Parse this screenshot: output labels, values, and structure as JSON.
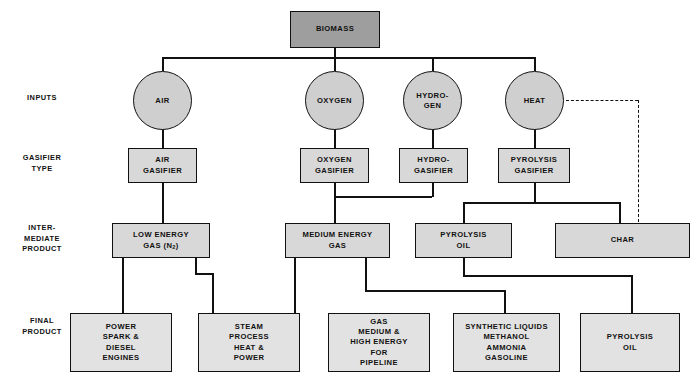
{
  "diagram": {
    "row_labels": [
      {
        "key": "inputs",
        "text": "INPUTS"
      },
      {
        "key": "gasifier",
        "text": "GASIFIER\nTYPE"
      },
      {
        "key": "intermediate",
        "text": "INTER-\nMEDIATE\nPRODUCT"
      },
      {
        "key": "final",
        "text": "FINAL\nPRODUCT"
      }
    ],
    "source": {
      "label": "BIOMASS"
    },
    "inputs": [
      {
        "label": "AIR"
      },
      {
        "label": "OXYGEN"
      },
      {
        "label": "HYDRO-\nGEN"
      },
      {
        "label": "HEAT"
      }
    ],
    "gasifiers": [
      {
        "label": "AIR\nGASIFIER"
      },
      {
        "label": "OXYGEN\nGASIFIER"
      },
      {
        "label": "HYDRO-\nGASIFIER"
      },
      {
        "label": "PYROLYSIS\nGASIFIER"
      }
    ],
    "intermediates": [
      {
        "label": "LOW ENERGY\nGAS (N2)",
        "label_pre": "LOW ENERGY\nGAS (N",
        "label_sub": "2",
        "label_post": ")"
      },
      {
        "label": "MEDIUM ENERGY\nGAS"
      },
      {
        "label": "PYROLYSIS\nOIL"
      },
      {
        "label": "CHAR"
      }
    ],
    "finals": [
      {
        "label": "POWER\nSPARK &\nDIESEL\nENGINES"
      },
      {
        "label": "STEAM\nPROCESS\nHEAT &\nPOWER"
      },
      {
        "label": "GAS\nMEDIUM &\nHIGH ENERGY\nFOR\nPIPELINE"
      },
      {
        "label": "SYNTHETIC LIQUIDS\nMETHANOL\nAMMONIA\nGASOLINE"
      },
      {
        "label": "PYROLYSIS\nOIL"
      }
    ],
    "colors": {
      "source_fill": "#9e9e9e",
      "node_fill": "#d8d8d8",
      "final_fill": "#e2e2e2",
      "circle_fill": "#cfcfcf",
      "line": "#111111",
      "background": "#ffffff"
    }
  }
}
